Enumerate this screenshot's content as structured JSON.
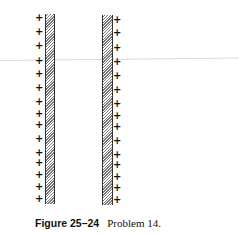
{
  "figure": {
    "label": "Figure 25–24",
    "caption": "Problem 14.",
    "charge_symbol": "+",
    "left_plate": {
      "charge_side": "left",
      "charges_y": [
        18,
        32,
        46,
        61,
        74,
        88,
        102,
        114,
        125,
        139,
        153,
        163,
        175,
        187,
        199
      ]
    },
    "right_plate": {
      "charge_side": "right",
      "charges_y": [
        20,
        33,
        48,
        62,
        76,
        90,
        104,
        116,
        127,
        141,
        155,
        165,
        177,
        188,
        200
      ]
    }
  }
}
